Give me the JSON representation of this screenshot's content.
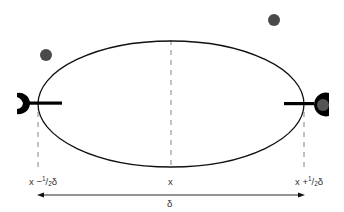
{
  "diagram": {
    "ellipse": {
      "cx": 171,
      "cy": 104,
      "rx": 133,
      "ry": 63,
      "stroke": "#111111"
    },
    "particles": [
      {
        "name": "particle-left",
        "cx": 46,
        "cy": 55,
        "r": 6,
        "color": "#4a4a4a"
      },
      {
        "name": "particle-top-right",
        "cx": 274,
        "cy": 20,
        "r": 6,
        "color": "#4a4a4a"
      },
      {
        "name": "particle-in-right-detector",
        "cx": 323,
        "cy": 105,
        "r": 6,
        "color": "#555555"
      }
    ],
    "detectors": [
      {
        "name": "left-detector",
        "side": "left",
        "cx": 24,
        "cy": 103,
        "color": "#000000"
      },
      {
        "name": "right-detector",
        "side": "right",
        "cx": 317,
        "cy": 104,
        "color": "#000000"
      }
    ],
    "labels": {
      "left_prefix": "x −",
      "left_num": "1",
      "left_slash": "/",
      "left_den": "2",
      "left_suffix": "δ",
      "center": "x",
      "right_prefix": "x +",
      "right_num": "1",
      "right_slash": "/",
      "right_den": "2",
      "right_suffix": "δ",
      "span": "δ"
    },
    "colors": {
      "line": "#111111",
      "dash": "#555555",
      "text": "#333333"
    }
  }
}
